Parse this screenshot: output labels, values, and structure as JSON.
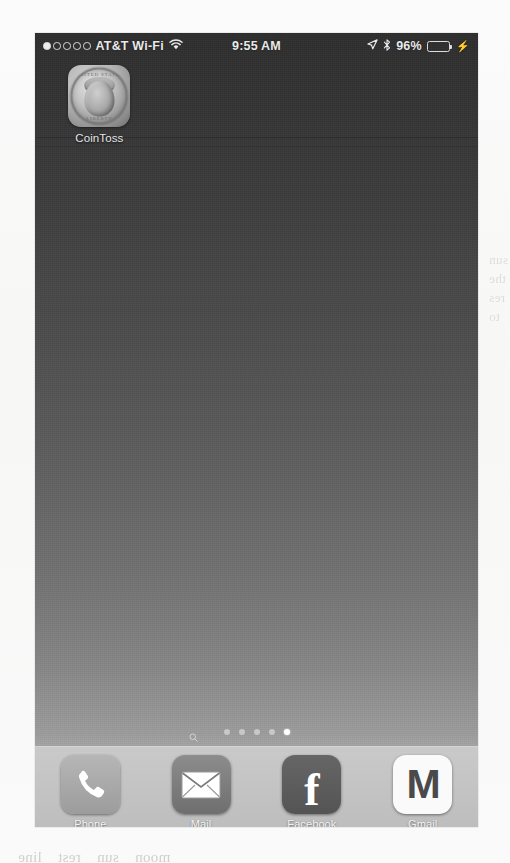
{
  "device": {
    "platform": "iOS",
    "screen_label": "home-screen"
  },
  "status_bar": {
    "signal_dots_total": 5,
    "signal_dots_filled": 1,
    "carrier": "AT&T Wi-Fi",
    "wifi_icon": "wifi-icon",
    "time": "9:55 AM",
    "location_icon": "location-arrow-icon",
    "bluetooth_icon": "bluetooth-icon",
    "battery_percent": "96%",
    "battery_fill_percent": 96,
    "charging_icon": "lightning-bolt-icon"
  },
  "home_screen": {
    "apps": [
      {
        "label": "CoinToss",
        "icon": "quarter-coin-icon",
        "coin_text_top": "UNITED STATES",
        "coin_text_bottom": "LIBERTY"
      }
    ],
    "page_indicator": {
      "search_icon": "search-icon",
      "pages": 5,
      "active_page": 5
    }
  },
  "dock": {
    "apps": [
      {
        "label": "Phone",
        "icon": "phone-handset-icon"
      },
      {
        "label": "Mail",
        "icon": "envelope-icon"
      },
      {
        "label": "Facebook",
        "icon": "facebook-f-icon",
        "glyph": "f"
      },
      {
        "label": "Gmail",
        "icon": "gmail-m-icon",
        "glyph": "M"
      }
    ]
  },
  "colors": {
    "wallpaper_top": "#2e2e2e",
    "wallpaper_bottom": "#a8a8a8",
    "dock_background": "#c8c8c8",
    "status_text": "#e9e9e9",
    "label_text": "#e6e6e6"
  },
  "scan_artifacts": {
    "right_margin_bleed": "sun\nthe\nres\nto",
    "bottom_bleed": "moon    sun    rest    line"
  }
}
